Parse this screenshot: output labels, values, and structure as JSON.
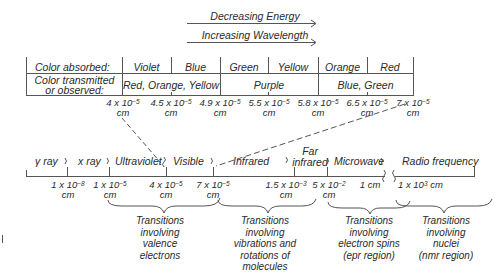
{
  "arrows": {
    "energy_label": "Decreasing Energy",
    "wavelength_label": "Increasing Wavelength"
  },
  "visible_table": {
    "row_absorbed": {
      "header": "Color absorbed:",
      "cells": [
        "Violet",
        "Blue",
        "Green",
        "Yellow",
        "Orange",
        "Red"
      ]
    },
    "row_observed": {
      "header_line1": "Color transmitted",
      "header_line2": "or observed:",
      "cells": [
        "Red, Orange, Yellow",
        "Purple",
        "Blue, Green"
      ]
    },
    "wavelengths": [
      {
        "mantissa": "4 x 10",
        "exp": "−5",
        "unit": "cm"
      },
      {
        "mantissa": "4.5 x 10",
        "exp": "−5",
        "unit": "cm"
      },
      {
        "mantissa": "4.9 x 10",
        "exp": "−5",
        "unit": "cm"
      },
      {
        "mantissa": "5.5 x 10",
        "exp": "−5",
        "unit": "cm"
      },
      {
        "mantissa": "5.8 x 10",
        "exp": "−5",
        "unit": "cm"
      },
      {
        "mantissa": "6.5 x 10",
        "exp": "−5",
        "unit": "cm"
      },
      {
        "mantissa": "7 x 10",
        "exp": "−5",
        "unit": "cm"
      }
    ]
  },
  "spectrum": {
    "regions": [
      "γ ray",
      "x ray",
      "Ultraviolet",
      "Visible",
      "Infrared",
      "Far",
      "infrared",
      "Microwave",
      "Radio frequency"
    ],
    "boundaries": [
      {
        "mantissa": "1 x 10",
        "exp": "−8",
        "unit": "cm"
      },
      {
        "mantissa": "1 x 10",
        "exp": "−5",
        "unit": "cm"
      },
      {
        "mantissa": "4 x 10",
        "exp": "−5",
        "unit": "cm"
      },
      {
        "mantissa": "7 x 10",
        "exp": "−5",
        "unit": "cm"
      },
      {
        "mantissa": "1.5 x 10",
        "exp": "−3",
        "unit": "cm"
      },
      {
        "mantissa": "5 x 10",
        "exp": "−2",
        "unit": "cm"
      },
      {
        "text": "1 cm"
      },
      {
        "mantissa": "1 x 10",
        "exp": "3",
        "unit": "cm"
      }
    ]
  },
  "transitions": [
    {
      "lines": [
        "Transitions",
        "involving",
        "valence",
        "electrons"
      ]
    },
    {
      "lines": [
        "Transitions",
        "involving",
        "vibrations and",
        "rotations of",
        "molecules"
      ]
    },
    {
      "lines": [
        "Transitions",
        "involving",
        "electron spins",
        "(epr region)"
      ]
    },
    {
      "lines": [
        "Transitions",
        "involving",
        "nuclei",
        "(nmr region)"
      ]
    }
  ],
  "colors": {
    "ink": "#2a2a2a",
    "line": "#555555",
    "background": "#ffffff"
  }
}
